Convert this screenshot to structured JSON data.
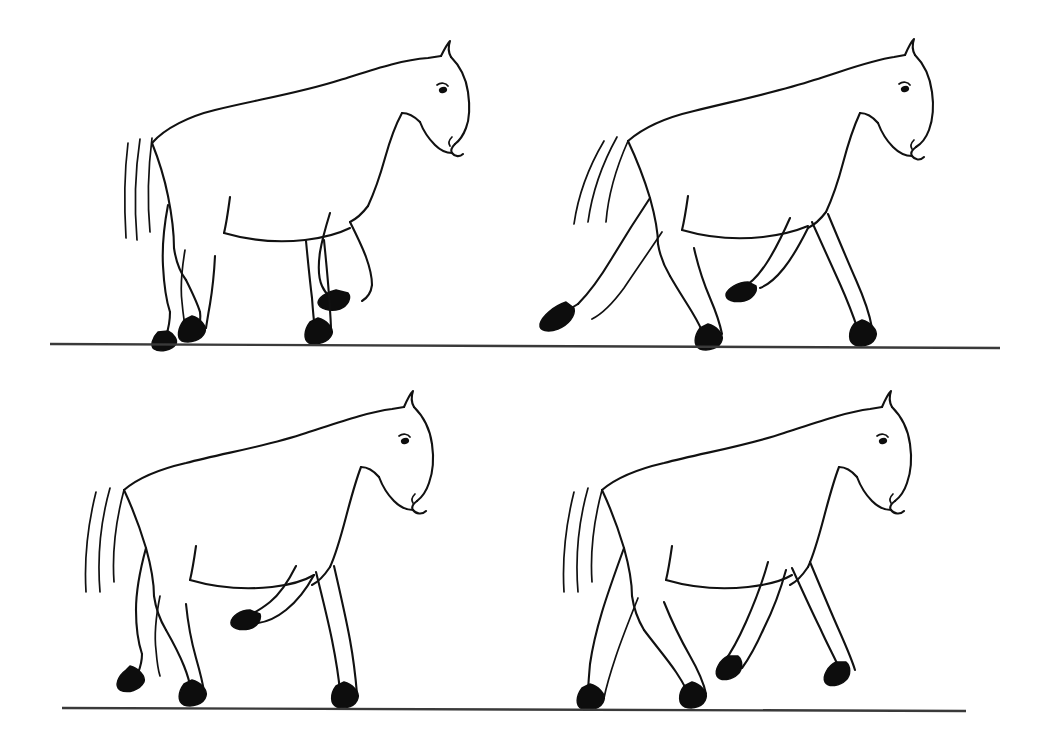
{
  "figure": {
    "medium": "black ink line art on white background",
    "background_color": "#ffffff",
    "ink_color": "#111111",
    "hoof_fill_color": "#0d0d0d",
    "ground_line_color": "#3a3a3a",
    "panel_count": 4,
    "rows": 2,
    "columns": 2
  },
  "ground_lines": [
    {
      "name": "upper-ground-line",
      "x1": 50,
      "y1": 344,
      "x2": 1000,
      "y2": 348
    },
    {
      "name": "lower-ground-line",
      "x1": 62,
      "y1": 708,
      "x2": 966,
      "y2": 711
    }
  ],
  "panels": [
    {
      "id": "panel-1",
      "position": "top-left",
      "label": "Phase 1",
      "pose": "Walk, near hind and off fore grounded; off hind and near fore lifted and flexed",
      "facing": "right",
      "hooves_on_ground": 2,
      "hooves_lifted": 2
    },
    {
      "id": "panel-2",
      "position": "top-right",
      "label": "Phase 2",
      "pose": "Extended trot, diagonal pairs, hind leg trailing far behind, foreleg reaching forward",
      "facing": "right",
      "hooves_on_ground": 2,
      "hooves_lifted": 2
    },
    {
      "id": "panel-3",
      "position": "bottom-left",
      "label": "Phase 3",
      "pose": "Walk, three hooves near ground, near foreleg folded and raised high",
      "facing": "right",
      "hooves_on_ground": 3,
      "hooves_lifted": 1
    },
    {
      "id": "panel-4",
      "position": "bottom-right",
      "label": "Phase 4",
      "pose": "Walk, all four legs spread in stride, two hooves grounded, two just leaving ground",
      "facing": "right",
      "hooves_on_ground": 2,
      "hooves_lifted": 2
    }
  ],
  "anatomy_parts": [
    "ear",
    "forelock",
    "poll",
    "eye",
    "muzzle",
    "nostril",
    "jaw",
    "crest",
    "neck",
    "withers",
    "back",
    "croup",
    "tail",
    "shoulder",
    "chest",
    "belly",
    "stifle",
    "hock",
    "cannon",
    "fetlock",
    "hoof"
  ]
}
